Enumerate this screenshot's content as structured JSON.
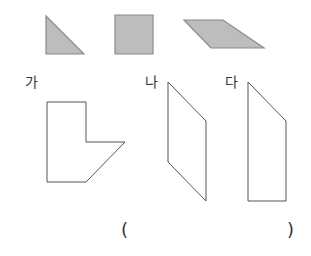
{
  "colors": {
    "piece_fill": "#bdbdbd",
    "piece_stroke": "#8a8a8a",
    "outline_stroke": "#555555",
    "text": "#333333"
  },
  "pieces": [
    {
      "name": "right-triangle",
      "points": "46,16 46,54 84,54"
    },
    {
      "name": "square",
      "points": "115,15 153,15 153,54 115,54"
    },
    {
      "name": "parallelogram",
      "points": "184,20 223,20 264,48 211,48"
    }
  ],
  "figures": [
    {
      "label": "가",
      "points": "47,102 86,102 86,142 125,142 86,182 47,182"
    },
    {
      "label": "나",
      "points": "168,82 206,121 206,201 168,162"
    },
    {
      "label": "다",
      "points": "248,82 286,121 286,201 248,201"
    }
  ],
  "answer": {
    "open_paren": "(",
    "close_paren": ")"
  }
}
